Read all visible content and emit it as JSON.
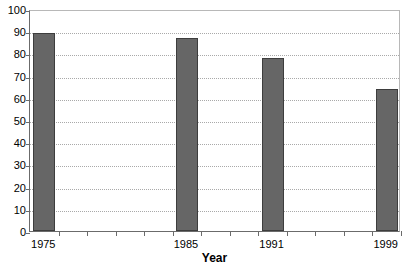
{
  "chart_data": {
    "type": "bar",
    "title": "",
    "xlabel": "Year",
    "ylabel": "",
    "categories": [
      "1975",
      "1985",
      "1991",
      "1999"
    ],
    "values": [
      89,
      87,
      78,
      64
    ],
    "ylim": [
      0,
      100
    ],
    "ytick_step": 10,
    "yticks": [
      0,
      10,
      20,
      30,
      40,
      50,
      60,
      70,
      80,
      90,
      100
    ],
    "ytick_labels": [
      "0",
      "10",
      "20",
      "30",
      "40",
      "50",
      "60",
      "70",
      "80",
      "90",
      "100"
    ],
    "grid": true,
    "grid_axis": "y",
    "grid_style": "dotted",
    "legend": false,
    "bar_color": "#666666",
    "bar_border_color": "#3d3d3d",
    "plot_border_color": "#b8b8b8",
    "axis_color": "#6b6b6b",
    "gridline_color": "#a9a9a9",
    "background": "#ffffff",
    "bars": [
      {
        "label": "1975",
        "value": 89,
        "slot": 0
      },
      {
        "label": "1985",
        "value": 87,
        "slot": 5
      },
      {
        "label": "1991",
        "value": 78,
        "slot": 8
      },
      {
        "label": "1999",
        "value": 64,
        "slot": 12
      }
    ],
    "x_slot_count": 13,
    "x_unlabeled_ticks": 13
  }
}
